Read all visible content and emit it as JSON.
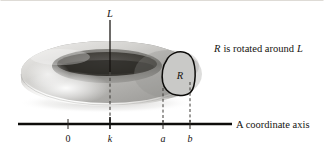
{
  "figure": {
    "title_caption": "R is rotated around L",
    "axis_name": "A coordinate axis",
    "region_label": "R",
    "vertical_axis_label": "L",
    "background_color": "#ffffff",
    "ink_color": "#15130f",
    "region_fill_color": "#c9c9c7",
    "solid_color": "#b9b9b7"
  },
  "coordinate_axis": {
    "label": "A coordinate axis",
    "ticks": [
      {
        "label": "0",
        "x": 68
      },
      {
        "label": "k",
        "x": 110
      },
      {
        "label": "a",
        "x": 163
      },
      {
        "label": "b",
        "x": 190
      }
    ],
    "line_start_x": 18,
    "line_end_x": 232,
    "line_y": 124
  },
  "vertical_axis": {
    "label": "L",
    "x": 110,
    "top_y": 20,
    "bottom_y": 124
  },
  "region": {
    "label": "R",
    "left_bound_tick": "a",
    "right_bound_tick": "b",
    "center_x": 181,
    "center_y": 77
  },
  "solid": {
    "shape_name": "torus",
    "description": "solid of revolution generated by rotating region R around line L"
  }
}
